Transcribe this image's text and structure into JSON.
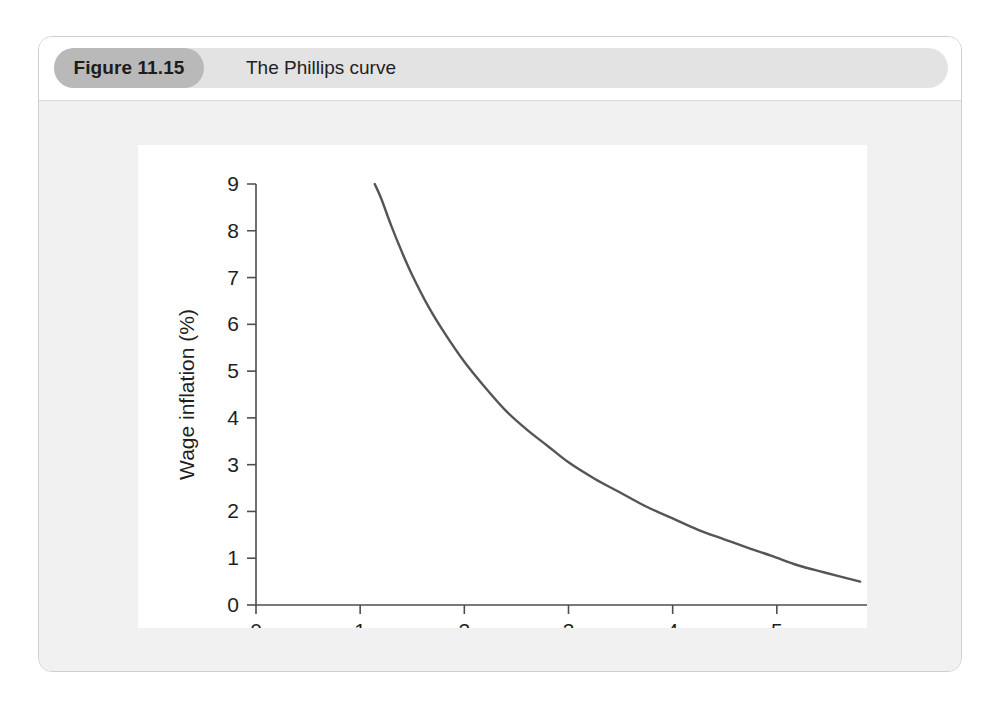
{
  "figure": {
    "badge_label": "Figure 11.15",
    "title": "The Phillips curve"
  },
  "chart_data": {
    "type": "line",
    "title": "The Phillips curve",
    "xlabel": "Unemployment (%)",
    "ylabel": "Wage inflation (%)",
    "xlim": [
      0,
      6
    ],
    "ylim": [
      0,
      9
    ],
    "xticks": [
      "0",
      "1",
      "2",
      "3",
      "4",
      "5",
      "6"
    ],
    "yticks": [
      "0",
      "1",
      "2",
      "3",
      "4",
      "5",
      "6",
      "7",
      "8",
      "9"
    ],
    "grid": false,
    "legend": null,
    "series": [
      {
        "name": "Phillips curve",
        "color": "#555555",
        "x": [
          1.14,
          1.2,
          1.3,
          1.4,
          1.5,
          1.65,
          1.8,
          2.0,
          2.2,
          2.4,
          2.6,
          2.8,
          3.0,
          3.25,
          3.5,
          3.75,
          4.0,
          4.25,
          4.5,
          4.75,
          4.95,
          5.2,
          5.45,
          5.8
        ],
        "y": [
          9.0,
          8.7,
          8.1,
          7.55,
          7.05,
          6.4,
          5.85,
          5.2,
          4.65,
          4.15,
          3.75,
          3.4,
          3.05,
          2.7,
          2.4,
          2.1,
          1.85,
          1.6,
          1.4,
          1.2,
          1.05,
          0.85,
          0.7,
          0.5
        ]
      }
    ]
  },
  "colors": {
    "card_border": "#cfcfcf",
    "header_bar": "#e3e3e3",
    "badge": "#b9b9b9",
    "mat": "#f1f1f1",
    "panel": "#ffffff",
    "curve": "#555555",
    "axis": "#4d4d4d",
    "text": "#1f1f1f"
  }
}
